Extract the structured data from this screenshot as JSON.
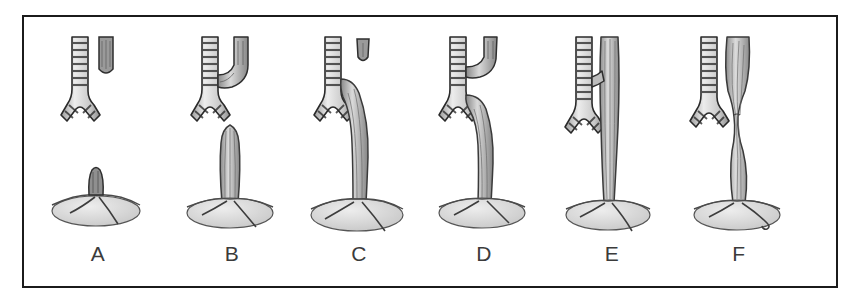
{
  "figure": {
    "style": "grayscale engraving line drawing",
    "frame_color": "#1b1b1b",
    "background_color": "#ffffff",
    "label_color": "#3b3b3b",
    "panel_count": 6
  },
  "palette": {
    "trachea_fill": "#e8e8e8",
    "trachea_stroke": "#2a2a2a",
    "cartilage_ring": "#3a3a3a",
    "esophagus_fill": "#cfcfcf",
    "esophagus_stroke": "#3c3c3c",
    "pouch_fill": "#9a9a9a",
    "stomach_fill": "#d8d8d8",
    "stomach_stroke": "#4a4a4a",
    "shadow": "#bdbdbd"
  },
  "panels": [
    {
      "id": "panel-a",
      "label": "A",
      "variant": "isolated esophageal atresia without fistula",
      "has_trachea": true,
      "has_carina": true,
      "upper_pouch": "blind, separate, short",
      "lower_segment": "short blind nub on stomach",
      "fistula": "none",
      "stomach": "small, flat"
    },
    {
      "id": "panel-b",
      "label": "B",
      "variant": "esophageal atresia with proximal tracheoesophageal fistula",
      "has_trachea": true,
      "has_carina": true,
      "upper_pouch": "joins trachea as proximal fistula",
      "lower_segment": "blind, rising from stomach",
      "fistula": "proximal",
      "stomach": "medium"
    },
    {
      "id": "panel-c",
      "label": "C",
      "variant": "esophageal atresia with distal tracheoesophageal fistula",
      "has_trachea": true,
      "has_carina": true,
      "upper_pouch": "small blind pouch, separate",
      "lower_segment": "long, joins trachea above carina",
      "fistula": "distal",
      "stomach": "large"
    },
    {
      "id": "panel-d",
      "label": "D",
      "variant": "esophageal atresia with proximal and distal fistulas",
      "has_trachea": true,
      "has_carina": true,
      "upper_pouch": "joins trachea high",
      "lower_segment": "joins trachea near carina",
      "fistula": "proximal and distal",
      "stomach": "medium"
    },
    {
      "id": "panel-e",
      "label": "E",
      "variant": "H-type tracheoesophageal fistula without atresia",
      "has_trachea": true,
      "has_carina": true,
      "upper_pouch": "continuous esophagus",
      "lower_segment": "continuous esophagus",
      "fistula": "short oblique H-type bridge",
      "stomach": "medium"
    },
    {
      "id": "panel-f",
      "label": "F",
      "variant": "congenital esophageal stenosis",
      "has_trachea": true,
      "has_carina": true,
      "upper_pouch": "continuous esophagus",
      "lower_segment": "continuous esophagus",
      "fistula": "none",
      "stomach": "medium with duodenal loop"
    }
  ]
}
